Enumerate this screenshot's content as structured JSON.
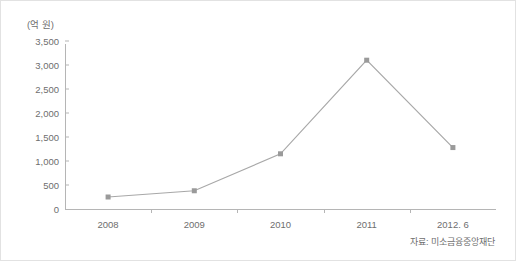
{
  "chart_data": {
    "type": "line",
    "title": "",
    "subtitle": "",
    "xlabel": "",
    "ylabel": "(억 원)",
    "unit_caption": "(억 원)",
    "categories": [
      "2008",
      "2009",
      "2010",
      "2011",
      "2012. 6"
    ],
    "values": [
      250,
      380,
      1150,
      3100,
      1280
    ],
    "series": [
      {
        "name": "",
        "values": [
          250,
          380,
          1150,
          3100,
          1280
        ]
      }
    ],
    "ylim": [
      0,
      3500
    ],
    "y_ticks": [
      0,
      500,
      1000,
      1500,
      2000,
      2500,
      3000,
      3500
    ],
    "y_tick_labels": [
      "0",
      "500",
      "1,000",
      "1,500",
      "2,000",
      "2,500",
      "3,000",
      "3,500"
    ],
    "grid": false,
    "legend": false,
    "legend_position": "none",
    "marker": "square",
    "line_color": "#a8a8a8",
    "marker_color": "#9a9a9a",
    "axis_color": "#b5b5b5",
    "text_color": "#6e6e6e",
    "background_color": "#ffffff",
    "annotations": []
  },
  "source": {
    "note": "자료: 미소금융중앙재단"
  }
}
